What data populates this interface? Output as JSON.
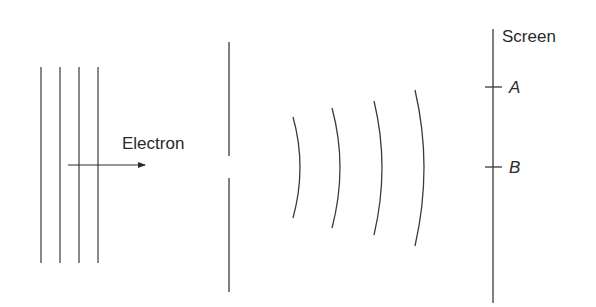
{
  "diagram": {
    "labels": {
      "electron": "Electron",
      "screen": "Screen",
      "point_a": "A",
      "point_b": "B"
    },
    "colors": {
      "stroke": "#3a3a3a",
      "text": "#2a2a2a",
      "background": "#ffffff"
    },
    "incident_wavefronts": {
      "count": 4,
      "type": "plane",
      "x": [
        41,
        60,
        79,
        98
      ],
      "y_top": 67,
      "y_bottom": 263
    },
    "electron_arrow": {
      "x1": 68,
      "x2": 145,
      "y": 165
    },
    "barrier": {
      "x": 229,
      "upper": {
        "y1": 42,
        "y2": 156
      },
      "lower": {
        "y1": 178,
        "y2": 292
      },
      "slit_center_y": 167
    },
    "diffracted_wavefronts": {
      "count": 4,
      "type": "circular",
      "arcs": [
        {
          "top": [
            293,
            117
          ],
          "mid": [
            300,
            167
          ],
          "bottom": [
            293,
            218
          ]
        },
        {
          "top": [
            332,
            108
          ],
          "mid": [
            340,
            167
          ],
          "bottom": [
            332,
            228
          ]
        },
        {
          "top": [
            374,
            101
          ],
          "mid": [
            382,
            167
          ],
          "bottom": [
            374,
            235
          ]
        },
        {
          "top": [
            415,
            90
          ],
          "mid": [
            424,
            167
          ],
          "bottom": [
            415,
            246
          ]
        }
      ]
    },
    "screen": {
      "x": 493,
      "y_top": 29,
      "y_bottom": 303,
      "marks": [
        {
          "label": "A",
          "y": 87
        },
        {
          "label": "B",
          "y": 167
        }
      ]
    }
  }
}
